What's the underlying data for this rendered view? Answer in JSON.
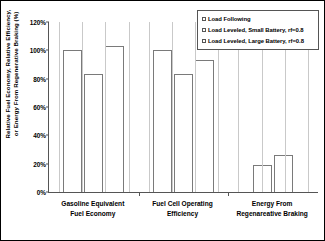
{
  "chart_data": {
    "type": "bar",
    "title": "",
    "xlabel": "",
    "ylabel": "Relative Fuel Economy, Relative Efficiency, or Energy From Regenerative Braking (%)",
    "ylim": [
      0,
      120
    ],
    "yticks": [
      "0%",
      "20%",
      "40%",
      "60%",
      "80%",
      "100%",
      "120%"
    ],
    "ytick_values": [
      0,
      20,
      40,
      60,
      80,
      100,
      120
    ],
    "grid": false,
    "legend_position": "top-right",
    "categories": [
      "Gasoline Equivalent Fuel Economy",
      "Fuel Cell Operating Efficiency",
      "Energy From Regenareative Braking"
    ],
    "category_lines": [
      [
        "Gasoline Equivalent",
        "Fuel Economy"
      ],
      [
        "Fuel Cell Operating",
        "Efficiency"
      ],
      [
        "Energy From",
        "Regenareative Braking"
      ]
    ],
    "series": [
      {
        "name": "Load Following",
        "values": [
          100,
          100,
          null
        ]
      },
      {
        "name": "Load Leveled, Small Battery, rf=0.8",
        "values": [
          83,
          83,
          19
        ]
      },
      {
        "name": "Load Leveled, Large Battery, rf=0.8",
        "values": [
          103,
          93,
          26
        ]
      }
    ],
    "bar_edge_color": "#7a7a7a",
    "bar_fill_color": "#ffffff",
    "axis_color": "#555555"
  },
  "legend": {
    "items": [
      {
        "label": "Load Following"
      },
      {
        "label": "Load Leveled, Small Battery, rf=0.8"
      },
      {
        "label": "Load Leveled, Large Battery, rf=0.8"
      }
    ]
  },
  "axis": {
    "y_title": "Relative Fuel Economy, Relative Efficiency, or Energy From Regenerative Braking (%)",
    "y_title_line1": "Relative Fuel Economy, Relative Efficiency,",
    "y_title_line2": "or Energy From Regenerative Braking (%)",
    "ticks": [
      "120%",
      "100%",
      "80%",
      "60%",
      "40%",
      "20%",
      "0%"
    ]
  }
}
